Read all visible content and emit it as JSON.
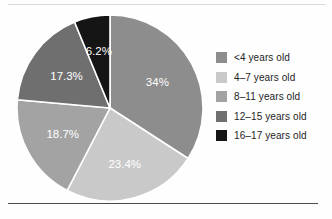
{
  "chart_data": {
    "type": "pie",
    "title": "",
    "subtitle": "",
    "xlabel": "",
    "ylabel": "",
    "legend_position": "right",
    "grid": false,
    "start_angle_deg": 0,
    "direction": "clockwise",
    "categories": [
      "<4 years old",
      "4–7 years old",
      "8–11 years old",
      "12–15 years old",
      "16–17 years old"
    ],
    "values": [
      34,
      23.4,
      18.7,
      17.3,
      6.2
    ],
    "data_labels": [
      "34%",
      "23.4%",
      "18.7%",
      "17.3%",
      "6.2%"
    ],
    "colors": [
      "#8d8d8d",
      "#c9c9c9",
      "#a3a3a3",
      "#6f6f6f",
      "#151515"
    ],
    "slices": [
      {
        "label": "<4 years old",
        "value": 34,
        "data_label": "34%",
        "color": "#8d8d8d",
        "label_color": "#ffffff"
      },
      {
        "label": "4–7 years old",
        "value": 23.4,
        "data_label": "23.4%",
        "color": "#c9c9c9",
        "label_color": "#ffffff"
      },
      {
        "label": "8–11 years old",
        "value": 18.7,
        "data_label": "18.7%",
        "color": "#a3a3a3",
        "label_color": "#ffffff"
      },
      {
        "label": "12–15 years old",
        "value": 17.3,
        "data_label": "17.3%",
        "color": "#6f6f6f",
        "label_color": "#ffffff"
      },
      {
        "label": "16–17 years old",
        "value": 6.2,
        "data_label": "6.2%",
        "color": "#151515",
        "label_color": "#ffffff"
      }
    ]
  },
  "legend": {
    "items": [
      {
        "label": "<4 years old",
        "color": "#8d8d8d"
      },
      {
        "label": "4–7 years old",
        "color": "#c9c9c9"
      },
      {
        "label": "8–11 years old",
        "color": "#a3a3a3"
      },
      {
        "label": "12–15 years old",
        "color": "#6f6f6f"
      },
      {
        "label": "16–17 years old",
        "color": "#151515"
      }
    ]
  },
  "labels": {
    "slice_0": "34%",
    "slice_1": "23.4%",
    "slice_2": "18.7%",
    "slice_3": "17.3%",
    "slice_4": "6.2%"
  },
  "colors": {
    "slice_separator": "#ffffff",
    "rule_top": "#dadada",
    "rule_bottom": "#4a4a4a",
    "background": "#fefefe",
    "text": "#1d1d1d"
  }
}
